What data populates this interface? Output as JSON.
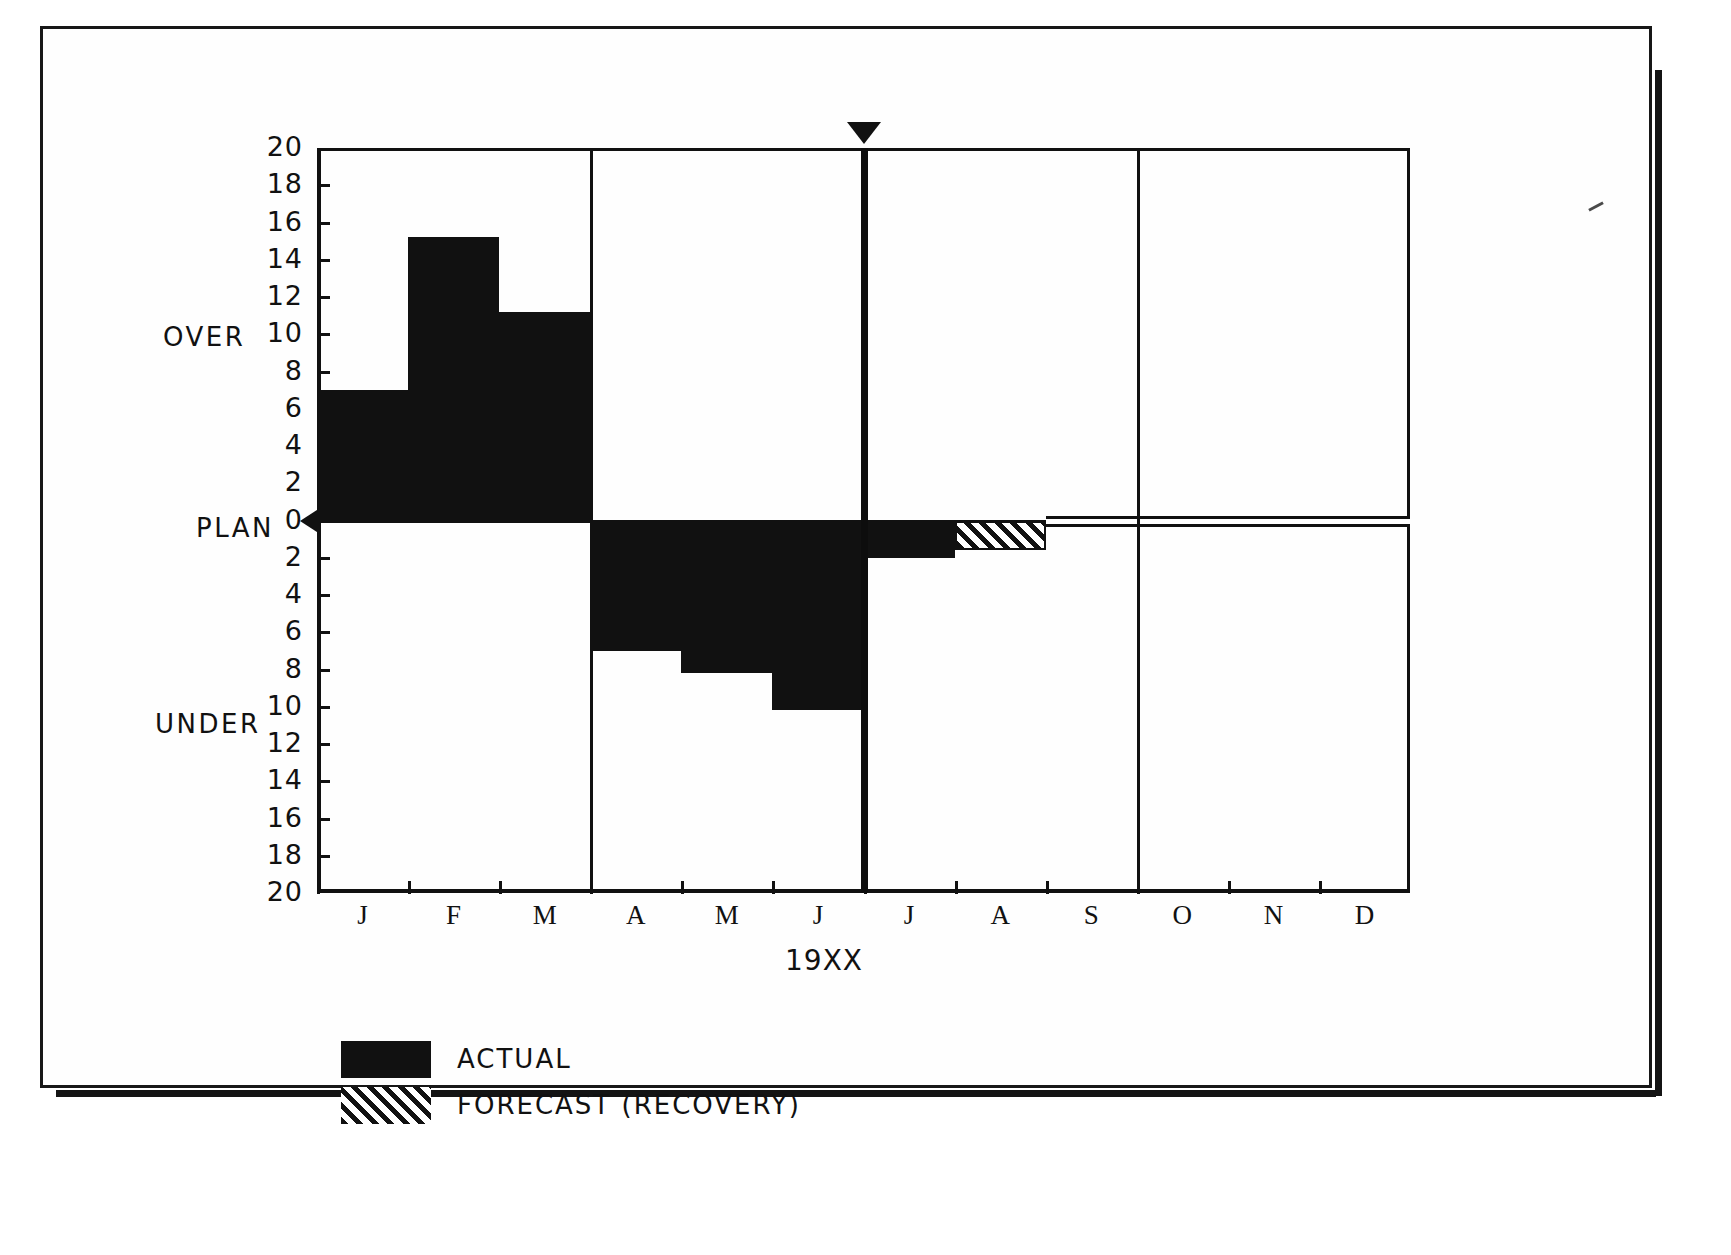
{
  "chart_data": {
    "type": "bar",
    "title": "",
    "xlabel": "19XX",
    "ylabel": "",
    "ylim": [
      -20,
      20
    ],
    "grid": false,
    "legend_position": "below-left",
    "upper_region_label": "OVER",
    "zero_region_label": "PLAN",
    "lower_region_label": "UNDER",
    "categories": [
      "J",
      "F",
      "M",
      "A",
      "M",
      "J",
      "J",
      "A",
      "S",
      "O",
      "N",
      "D"
    ],
    "y_ticks_upper": [
      "20",
      "18",
      "16",
      "14",
      "12",
      "10",
      "8",
      "6",
      "4",
      "2",
      "0"
    ],
    "y_ticks_lower": [
      "2",
      "4",
      "6",
      "8",
      "10",
      "12",
      "14",
      "16",
      "18",
      "20"
    ],
    "quarter_dividers_after": [
      "M",
      "J",
      "S"
    ],
    "current_period_marker": {
      "label": "",
      "after_category": "J",
      "icon": "down-triangle-marker"
    },
    "series": [
      {
        "name": "ACTUAL",
        "fill": "solid-black",
        "values": [
          7.0,
          15.2,
          11.2,
          -7.0,
          -8.2,
          -10.2,
          -2.0,
          null,
          null,
          null,
          null,
          null
        ]
      },
      {
        "name": "FORECAST (RECOVERY)",
        "fill": "diagonal-hatch",
        "values": [
          null,
          null,
          null,
          null,
          null,
          null,
          null,
          -1.6,
          0,
          0,
          0,
          0
        ]
      }
    ]
  },
  "legend": {
    "items": [
      {
        "label": "ACTUAL",
        "swatch": "solid-swatch"
      },
      {
        "label": "FORECAST (RECOVERY)",
        "swatch": "hatch-swatch"
      }
    ]
  },
  "colors": {
    "ink": "#111111",
    "paper": "#ffffff"
  }
}
